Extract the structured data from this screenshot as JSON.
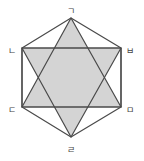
{
  "diagram": {
    "type": "hexagon-with-hexagram",
    "colors": {
      "stroke": "#4a4a4a",
      "fill": "#d4d4d4",
      "background": "#ffffff",
      "label": "#444444"
    },
    "vertices": [
      {
        "id": "g",
        "label": "ㄱ",
        "x": 71,
        "y": 18,
        "lx": 71,
        "ly": 11
      },
      {
        "id": "n",
        "label": "ㄴ",
        "x": 22,
        "y": 48,
        "lx": 12,
        "ly": 51
      },
      {
        "id": "d",
        "label": "ㄷ",
        "x": 22,
        "y": 107,
        "lx": 12,
        "ly": 110
      },
      {
        "id": "r",
        "label": "ㄹ",
        "x": 71,
        "y": 137,
        "lx": 71,
        "ly": 150
      },
      {
        "id": "m",
        "label": "ㅁ",
        "x": 121,
        "y": 107,
        "lx": 130,
        "ly": 110
      },
      {
        "id": "b",
        "label": "ㅂ",
        "x": 121,
        "y": 48,
        "lx": 130,
        "ly": 51
      }
    ],
    "triangles": [
      [
        "g",
        "d",
        "m"
      ],
      [
        "r",
        "n",
        "b"
      ]
    ],
    "hexagon": [
      "g",
      "n",
      "d",
      "r",
      "m",
      "b"
    ],
    "rectangle": [
      "n",
      "b",
      "m",
      "d"
    ]
  }
}
